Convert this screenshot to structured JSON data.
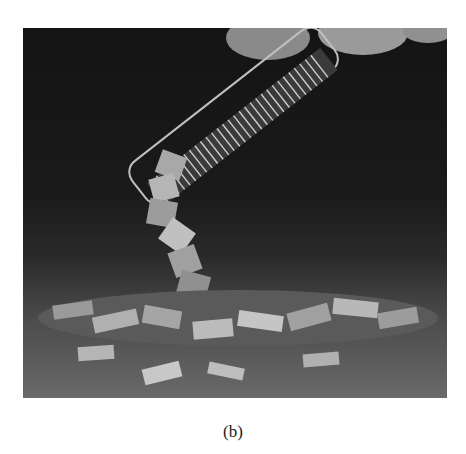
{
  "figure": {
    "caption": "(b)"
  }
}
